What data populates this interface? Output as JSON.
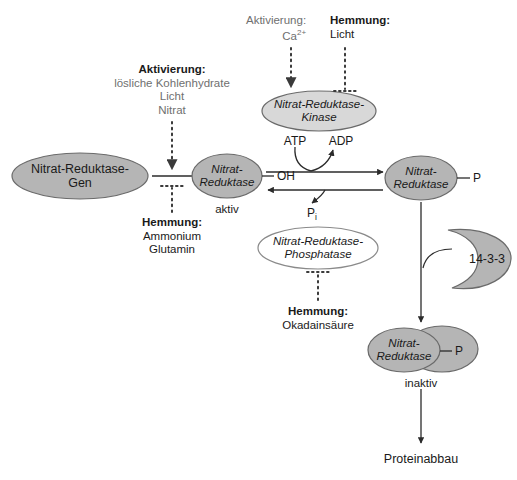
{
  "diagram": {
    "colors": {
      "node_fill": "#b5b5b5",
      "node_fill_light": "#d8d8d8",
      "node_stroke": "#6a6a6a",
      "white_fill": "#ffffff",
      "text_dark": "#1a1a1a",
      "text_gray": "#6f6f6f",
      "line": "#2b2b2b",
      "dotted": "#3a3a3a"
    }
  },
  "nodes": {
    "gene": {
      "line1": "Nitrat-Reduktase-",
      "line2": "Gen"
    },
    "nr_active": {
      "line1": "Nitrat-",
      "line2": "Reduktase",
      "tag": "OH",
      "caption": "aktiv"
    },
    "kinase": {
      "line1": "Nitrat-Reduktase-",
      "line2": "Kinase"
    },
    "phosphatase": {
      "line1": "Nitrat-Reduktase-",
      "line2": "Phosphatase"
    },
    "nr_phospho": {
      "line1": "Nitrat-",
      "line2": "Reduktase",
      "tag": "P"
    },
    "protein_1433": {
      "label": "14-3-3"
    },
    "nr_inactive": {
      "line1": "Nitrat-",
      "line2": "Reduktase",
      "tag": "P",
      "caption": "inaktiv"
    },
    "degradation": {
      "label": "Proteinabbau"
    }
  },
  "regulators": {
    "gene_activation": {
      "heading": "Aktivierung:",
      "items": [
        "lösliche Kohlenhydrate",
        "Licht",
        "Nitrat"
      ]
    },
    "gene_inhibition": {
      "heading": "Hemmung:",
      "items": [
        "Ammonium",
        "Glutamin"
      ]
    },
    "kinase_activation": {
      "heading": "Aktivierung:",
      "items": [
        "Ca2+"
      ]
    },
    "kinase_inhibition": {
      "heading": "Hemmung:",
      "items": [
        "Licht"
      ]
    },
    "phosphatase_inhibition": {
      "heading": "Hemmung:",
      "items": [
        "Okadainsäure"
      ]
    }
  },
  "cofactors": {
    "atp": "ATP",
    "adp": "ADP",
    "pi_base": "P",
    "pi_sub": "i"
  }
}
